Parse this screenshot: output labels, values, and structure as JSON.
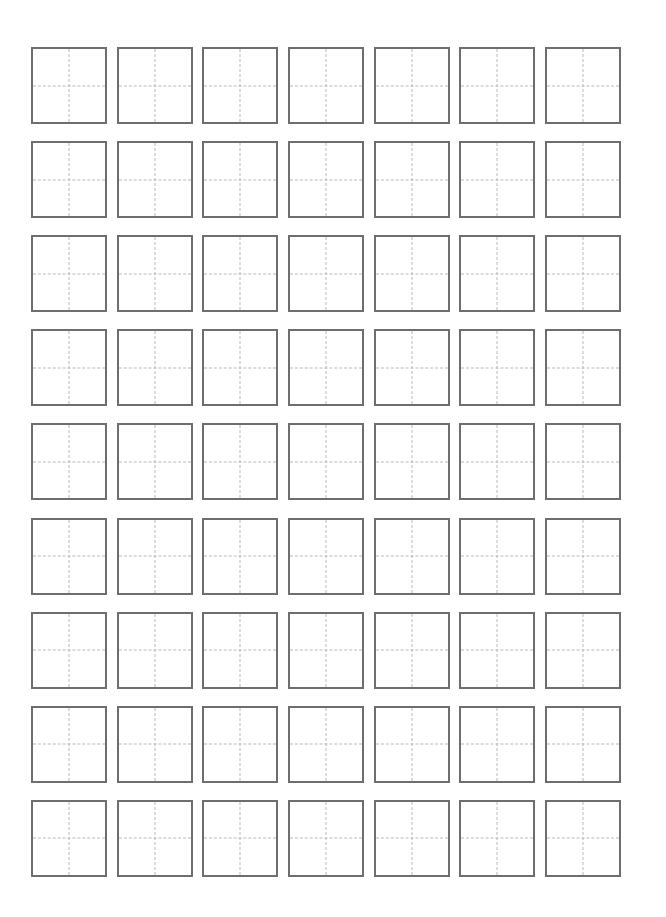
{
  "page": {
    "background_color": "#ffffff",
    "width": 666,
    "height": 917
  },
  "grid": {
    "name": "tian-zi-ge-practice-grid",
    "rows": 9,
    "columns": 7,
    "total_cells": 63,
    "cell_width": 76,
    "cell_height": 77,
    "column_gap": 10,
    "row_gap": 17,
    "origin_x": 31,
    "origin_y": 47,
    "border_color": "#6e6e6e",
    "border_width": 2.5,
    "guide_color": "#b9b9b9",
    "guide_style": "dashed",
    "guide_width": 1.5,
    "cell_fill": "#ffffff"
  },
  "cells": [
    {
      "row": 1,
      "col": 1,
      "content": ""
    },
    {
      "row": 1,
      "col": 2,
      "content": ""
    },
    {
      "row": 1,
      "col": 3,
      "content": ""
    },
    {
      "row": 1,
      "col": 4,
      "content": ""
    },
    {
      "row": 1,
      "col": 5,
      "content": ""
    },
    {
      "row": 1,
      "col": 6,
      "content": ""
    },
    {
      "row": 1,
      "col": 7,
      "content": ""
    },
    {
      "row": 2,
      "col": 1,
      "content": ""
    },
    {
      "row": 2,
      "col": 2,
      "content": ""
    },
    {
      "row": 2,
      "col": 3,
      "content": ""
    },
    {
      "row": 2,
      "col": 4,
      "content": ""
    },
    {
      "row": 2,
      "col": 5,
      "content": ""
    },
    {
      "row": 2,
      "col": 6,
      "content": ""
    },
    {
      "row": 2,
      "col": 7,
      "content": ""
    },
    {
      "row": 3,
      "col": 1,
      "content": ""
    },
    {
      "row": 3,
      "col": 2,
      "content": ""
    },
    {
      "row": 3,
      "col": 3,
      "content": ""
    },
    {
      "row": 3,
      "col": 4,
      "content": ""
    },
    {
      "row": 3,
      "col": 5,
      "content": ""
    },
    {
      "row": 3,
      "col": 6,
      "content": ""
    },
    {
      "row": 3,
      "col": 7,
      "content": ""
    },
    {
      "row": 4,
      "col": 1,
      "content": ""
    },
    {
      "row": 4,
      "col": 2,
      "content": ""
    },
    {
      "row": 4,
      "col": 3,
      "content": ""
    },
    {
      "row": 4,
      "col": 4,
      "content": ""
    },
    {
      "row": 4,
      "col": 5,
      "content": ""
    },
    {
      "row": 4,
      "col": 6,
      "content": ""
    },
    {
      "row": 4,
      "col": 7,
      "content": ""
    },
    {
      "row": 5,
      "col": 1,
      "content": ""
    },
    {
      "row": 5,
      "col": 2,
      "content": ""
    },
    {
      "row": 5,
      "col": 3,
      "content": ""
    },
    {
      "row": 5,
      "col": 4,
      "content": ""
    },
    {
      "row": 5,
      "col": 5,
      "content": ""
    },
    {
      "row": 5,
      "col": 6,
      "content": ""
    },
    {
      "row": 5,
      "col": 7,
      "content": ""
    },
    {
      "row": 6,
      "col": 1,
      "content": ""
    },
    {
      "row": 6,
      "col": 2,
      "content": ""
    },
    {
      "row": 6,
      "col": 3,
      "content": ""
    },
    {
      "row": 6,
      "col": 4,
      "content": ""
    },
    {
      "row": 6,
      "col": 5,
      "content": ""
    },
    {
      "row": 6,
      "col": 6,
      "content": ""
    },
    {
      "row": 6,
      "col": 7,
      "content": ""
    },
    {
      "row": 7,
      "col": 1,
      "content": ""
    },
    {
      "row": 7,
      "col": 2,
      "content": ""
    },
    {
      "row": 7,
      "col": 3,
      "content": ""
    },
    {
      "row": 7,
      "col": 4,
      "content": ""
    },
    {
      "row": 7,
      "col": 5,
      "content": ""
    },
    {
      "row": 7,
      "col": 6,
      "content": ""
    },
    {
      "row": 7,
      "col": 7,
      "content": ""
    },
    {
      "row": 8,
      "col": 1,
      "content": ""
    },
    {
      "row": 8,
      "col": 2,
      "content": ""
    },
    {
      "row": 8,
      "col": 3,
      "content": ""
    },
    {
      "row": 8,
      "col": 4,
      "content": ""
    },
    {
      "row": 8,
      "col": 5,
      "content": ""
    },
    {
      "row": 8,
      "col": 6,
      "content": ""
    },
    {
      "row": 8,
      "col": 7,
      "content": ""
    },
    {
      "row": 9,
      "col": 1,
      "content": ""
    },
    {
      "row": 9,
      "col": 2,
      "content": ""
    },
    {
      "row": 9,
      "col": 3,
      "content": ""
    },
    {
      "row": 9,
      "col": 4,
      "content": ""
    },
    {
      "row": 9,
      "col": 5,
      "content": ""
    },
    {
      "row": 9,
      "col": 6,
      "content": ""
    },
    {
      "row": 9,
      "col": 7,
      "content": ""
    }
  ]
}
